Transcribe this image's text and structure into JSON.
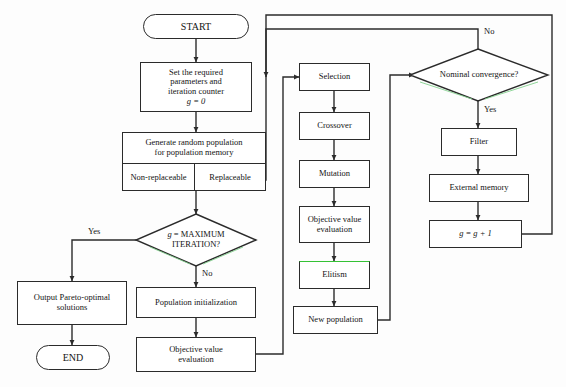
{
  "diagram": {
    "colors": {
      "stroke": "#2b2b2b",
      "background": "#fdfdfd",
      "node_fill": "#ffffff",
      "accent_green": "#35c235",
      "text": "#141414"
    },
    "nodes": {
      "start": "START",
      "set_params_l1": "Set the required",
      "set_params_l2": "parameters and",
      "set_params_l3": "iteration counter",
      "set_params_l4": "g = 0",
      "generate_l1": "Generate random population",
      "generate_l2": "for population memory",
      "non_replaceable": "Non-replaceable",
      "replaceable": "Replaceable",
      "max_iteration_l1": "g = MAXIMUM",
      "max_iteration_l2": "ITERATION?",
      "output_pareto_l1": "Output Pareto-optimal",
      "output_pareto_l2": "solutions",
      "end": "END",
      "population_initialization": "Population initialization",
      "objective_value_bottom_l1": "Objective value",
      "objective_value_bottom_l2": "evaluation",
      "selection": "Selection",
      "crossover": "Crossover",
      "mutation": "Mutation",
      "objective_value_mid_l1": "Objective value",
      "objective_value_mid_l2": "evaluation",
      "elitism": "Elitism",
      "new_population": "New population",
      "nominal_convergence": "Nominal convergence?",
      "filter": "Filter",
      "external_memory": "External memory",
      "increment": "g = g + 1"
    },
    "edge_labels": {
      "yes_max_iteration": "Yes",
      "no_max_iteration": "No",
      "no_convergence": "No",
      "yes_convergence": "Yes"
    }
  }
}
